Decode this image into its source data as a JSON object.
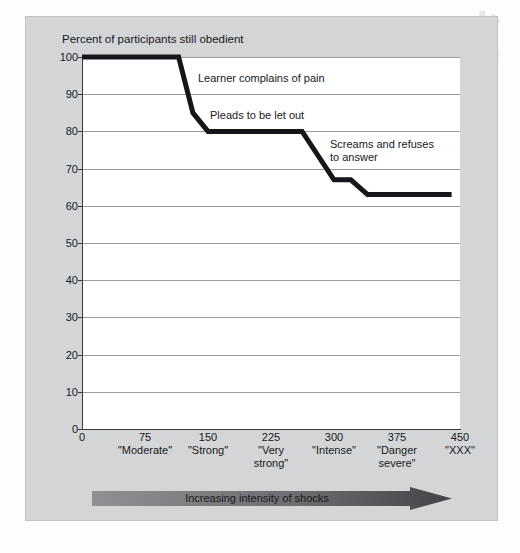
{
  "figure": {
    "bleed_through_text": "the",
    "bleed_through_text_small": "inside",
    "ghost_left": "",
    "ghost_right": ""
  },
  "chart_data": {
    "type": "line",
    "title": "Percent of participants still obedient",
    "xlabel": "Increasing intensity of shocks",
    "ylabel": "Percent of participants still obedient",
    "xlim": [
      0,
      450
    ],
    "ylim": [
      0,
      100
    ],
    "grid": true,
    "legend": "none",
    "y_ticks": [
      0,
      10,
      20,
      30,
      40,
      50,
      60,
      70,
      80,
      90,
      100
    ],
    "x_ticks": [
      {
        "value": 0,
        "num": "0",
        "label": ""
      },
      {
        "value": 75,
        "num": "75",
        "label": "\"Moderate\""
      },
      {
        "value": 150,
        "num": "150",
        "label": "\"Strong\""
      },
      {
        "value": 225,
        "num": "225",
        "label": "\"Very\nstrong\""
      },
      {
        "value": 300,
        "num": "300",
        "label": "\"Intense\""
      },
      {
        "value": 375,
        "num": "375",
        "label": "\"Danger\nsevere\""
      },
      {
        "value": 450,
        "num": "450",
        "label": "\"XXX\""
      }
    ],
    "series": [
      {
        "name": "Percent still obedient",
        "points": [
          {
            "x": 0,
            "y": 100
          },
          {
            "x": 115,
            "y": 100
          },
          {
            "x": 132,
            "y": 85
          },
          {
            "x": 150,
            "y": 80
          },
          {
            "x": 262,
            "y": 80
          },
          {
            "x": 300,
            "y": 67
          },
          {
            "x": 320,
            "y": 67
          },
          {
            "x": 340,
            "y": 63
          },
          {
            "x": 440,
            "y": 63
          }
        ]
      }
    ],
    "annotations": [
      {
        "text": "Learner complains of pain",
        "x_px": 198,
        "y_px": 72
      },
      {
        "text": "Pleads to be let out",
        "x_px": 210,
        "y_px": 109
      },
      {
        "text": "Screams and refuses\nto answer",
        "x_px": 330,
        "y_px": 138
      }
    ],
    "arrow_label": "Increasing intensity of shocks",
    "colors": {
      "line": "#15151a",
      "panel": "#d4d5d7",
      "plot_bg": "#ffffff",
      "gridline": "#9a9b9e",
      "axis": "#3a3a3c",
      "arrow_start": "#8c8d90",
      "arrow_end": "#4a4b4e",
      "text": "#18181a"
    }
  }
}
